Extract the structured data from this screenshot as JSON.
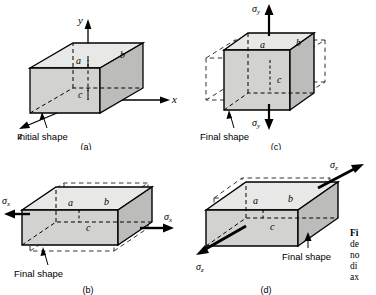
{
  "figure": {
    "dimension_labels": {
      "a": "a",
      "b": "b",
      "c": "c"
    }
  },
  "panels": [
    {
      "id": "a",
      "letter": "(a)",
      "shape_label": "Initial shape",
      "axes": {
        "x": "x",
        "y": "y",
        "z": "z"
      },
      "dims": [
        "a",
        "b",
        "c"
      ],
      "stress": null
    },
    {
      "id": "c",
      "letter": "(c)",
      "shape_label": "Final shape",
      "dims": [
        "a",
        "b",
        "c"
      ],
      "stress": {
        "symbol": "σ",
        "subscript": "y",
        "top_label": "σy",
        "bottom_label": "σy"
      }
    },
    {
      "id": "b",
      "letter": "(b)",
      "shape_label": "Final shape",
      "dims": [
        "a",
        "b",
        "c"
      ],
      "stress": {
        "symbol": "σ",
        "subscript": "x",
        "left_label": "σx",
        "right_label": "σx"
      }
    },
    {
      "id": "d",
      "letter": "(d)",
      "shape_label": "Final shape",
      "dims": [
        "a",
        "b",
        "c"
      ],
      "stress": {
        "symbol": "σ",
        "subscript": "z",
        "near_label": "σz",
        "far_label": "σz"
      }
    }
  ],
  "side_caption": {
    "lines": [
      "Fi",
      "de",
      "no",
      "di",
      "ax"
    ]
  },
  "colors": {
    "face_light": "#e8e8e6",
    "face_mid": "#d2d2d0",
    "face_dark": "#bcbcba",
    "line": "#000000",
    "dashed": "#3a3a3a",
    "background": "#ffffff"
  }
}
